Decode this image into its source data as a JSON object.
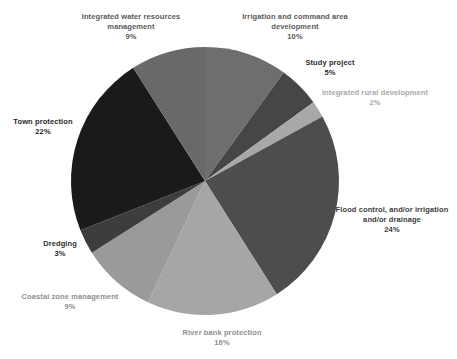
{
  "chart_data": {
    "type": "pie",
    "title": "",
    "legend_position": "none",
    "labels_outside": true,
    "geometry": {
      "cx": 205,
      "cy": 181,
      "radius": 134,
      "start_angle_deg": 0,
      "direction": "clockwise"
    },
    "slices": [
      {
        "name": "Irrigation and command area development",
        "value_pct": 10,
        "pct_label": "10%",
        "color": "#6e6e6e",
        "label_color": "#595959",
        "label_lines": [
          "Irrigation and command area",
          "development"
        ],
        "label_cx": 295,
        "label_top": 12
      },
      {
        "name": "Study project",
        "value_pct": 5,
        "pct_label": "5%",
        "color": "#464646",
        "label_color": "#2e2e2e",
        "label_lines": [
          "Study project"
        ],
        "label_cx": 330,
        "label_top": 58
      },
      {
        "name": "Integrated rural development",
        "value_pct": 2,
        "pct_label": "2%",
        "color": "#a8a8a8",
        "label_color": "#a8a8a8",
        "label_lines": [
          "Integrated rural development"
        ],
        "label_cx": 375,
        "label_top": 88
      },
      {
        "name": "Flood control, and/or irrigation and/or drainage",
        "value_pct": 24,
        "pct_label": "24%",
        "color": "#4d4d4d",
        "label_color": "#3b3b3b",
        "label_lines": [
          "Flood control, and/or irrigation",
          "and/or drainage"
        ],
        "label_cx": 392,
        "label_top": 205
      },
      {
        "name": "River bank protection",
        "value_pct": 16,
        "pct_label": "16%",
        "color": "#a6a6a6",
        "label_color": "#8f8f8f",
        "label_lines": [
          "River bank protection"
        ],
        "label_cx": 222,
        "label_top": 328
      },
      {
        "name": "Coastal zone management",
        "value_pct": 9,
        "pct_label": "9%",
        "color": "#9a9a9a",
        "label_color": "#8f8f8f",
        "label_lines": [
          "Coastal zone management"
        ],
        "label_cx": 70,
        "label_top": 292
      },
      {
        "name": "Dredging",
        "value_pct": 3,
        "pct_label": "3%",
        "color": "#3d3d3d",
        "label_color": "#2e2e2e",
        "label_lines": [
          "Dredging"
        ],
        "label_cx": 60,
        "label_top": 239
      },
      {
        "name": "Town protection",
        "value_pct": 22,
        "pct_label": "22%",
        "color": "#1a1a1a",
        "label_color": "#1f1f1f",
        "label_lines": [
          "Town protection"
        ],
        "label_cx": 43,
        "label_top": 117
      },
      {
        "name": "Integrated water resources management",
        "value_pct": 9,
        "pct_label": "9%",
        "color": "#696969",
        "label_color": "#595959",
        "label_lines": [
          "Integrated water resources",
          "management"
        ],
        "label_cx": 131,
        "label_top": 12
      }
    ]
  }
}
